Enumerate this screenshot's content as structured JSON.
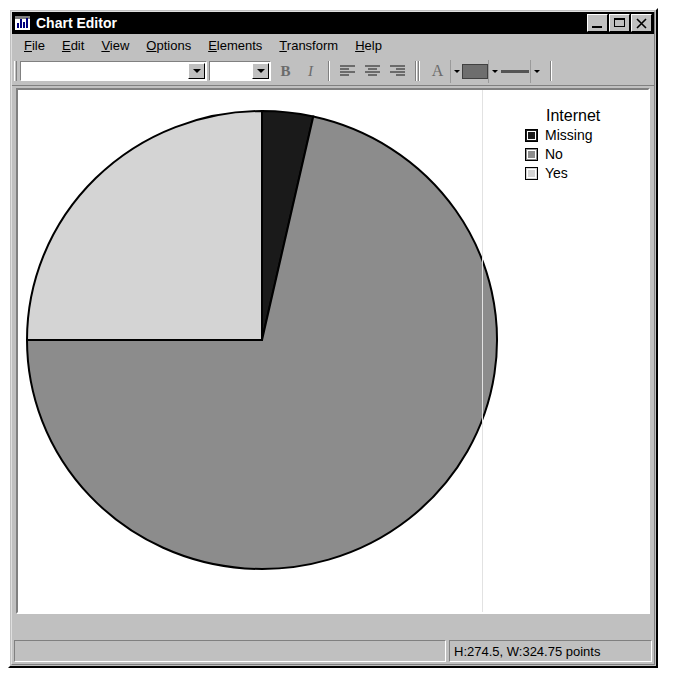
{
  "window": {
    "title": "Chart Editor",
    "icon": "chart-app-icon",
    "buttons": {
      "minimize": "minimize-icon",
      "maximize": "maximize-icon",
      "close": "close-icon"
    }
  },
  "menubar": {
    "items": [
      {
        "label": "File",
        "accel": "F"
      },
      {
        "label": "Edit",
        "accel": "E"
      },
      {
        "label": "View",
        "accel": "V"
      },
      {
        "label": "Options",
        "accel": "O"
      },
      {
        "label": "Elements",
        "accel": "E"
      },
      {
        "label": "Transform",
        "accel": "T"
      },
      {
        "label": "Help",
        "accel": "H"
      }
    ]
  },
  "toolbar": {
    "font_combo_value": "",
    "size_combo_value": "",
    "bold_label": "B",
    "italic_label": "I",
    "align_left": "align-left-icon",
    "align_center": "align-center-icon",
    "align_right": "align-right-icon",
    "text_label": "A",
    "color_swatch": "#6e6e6e",
    "line_weight": "line-weight-icon"
  },
  "legend": {
    "title": "Internet",
    "entries": [
      {
        "label": "Missing",
        "color": "#1a1a1a"
      },
      {
        "label": "No",
        "color": "#8c8c8c"
      },
      {
        "label": "Yes",
        "color": "#d4d4d4"
      }
    ]
  },
  "statusbar": {
    "left_text": "",
    "right_text": "H:274.5, W:324.75 points"
  },
  "chart_data": {
    "type": "pie",
    "title": "",
    "legend_title": "Internet",
    "legend_position": "right",
    "categories": [
      "Missing",
      "No",
      "Yes"
    ],
    "values": [
      3.5,
      71.5,
      25.0
    ],
    "unit": "percent",
    "colors": [
      "#1a1a1a",
      "#8c8c8c",
      "#d4d4d4"
    ],
    "start_angle_deg": 270,
    "direction": "clockwise",
    "slice_border_color": "#000000",
    "geometry": {
      "center_x": 268,
      "center_y": 368,
      "radius_x": 235,
      "radius_y": 229
    },
    "xlabel": "",
    "ylabel": "",
    "grid": false
  }
}
